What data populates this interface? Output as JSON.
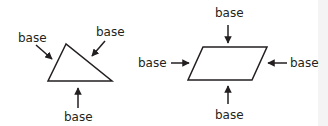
{
  "colors": {
    "stroke": "#231f20",
    "background": "#ffffff",
    "edge_strip": "#f4f4f4"
  },
  "triangle": {
    "labels": {
      "left": "base",
      "right": "base",
      "bottom": "base"
    }
  },
  "parallelogram": {
    "labels": {
      "top": "base",
      "left": "base",
      "right": "base",
      "bottom": "base"
    }
  }
}
